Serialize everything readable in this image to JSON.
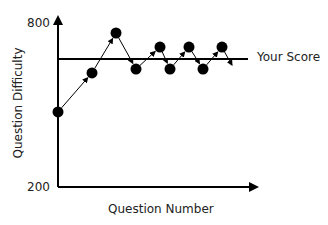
{
  "chart_data": {
    "type": "line",
    "title": "",
    "xlabel": "Question Number",
    "ylabel": "Question Difficulty",
    "ylim": [
      200,
      800
    ],
    "y_ticks": [
      "800",
      "200"
    ],
    "grid": false,
    "x": [
      1,
      2,
      3,
      4,
      5,
      6,
      7,
      8,
      9
    ],
    "series": [
      {
        "name": "Question Difficulty",
        "values": [
          473,
          615,
          760,
          629,
          709,
          629,
          709,
          629,
          709
        ]
      }
    ],
    "reference_lines": [
      {
        "name": "Your Score",
        "value": 665
      }
    ],
    "annotations": [
      "Your Score"
    ],
    "colors": {
      "line": "#000000",
      "points": "#000000",
      "axis": "#000000"
    }
  },
  "labels": {
    "y_top": "800",
    "y_bottom": "200",
    "xlabel": "Question Number",
    "ylabel": "Question Difficulty",
    "your_score": "Your Score"
  }
}
